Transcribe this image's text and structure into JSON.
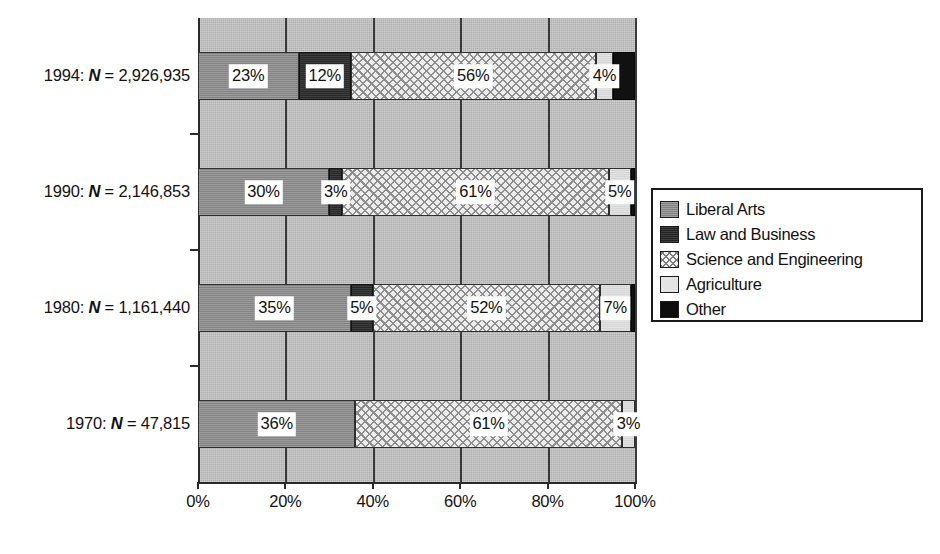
{
  "chart_data": {
    "type": "bar",
    "orientation": "horizontal",
    "stacked": true,
    "normalized_percent": true,
    "title": "",
    "subtitle": "",
    "xlabel": "",
    "ylabel": "",
    "xlim": [
      0,
      100
    ],
    "xticks": [
      0,
      20,
      40,
      60,
      80,
      100
    ],
    "xtick_labels": [
      "0%",
      "20%",
      "40%",
      "60%",
      "80%",
      "100%"
    ],
    "grid": true,
    "grid_axis": "x",
    "legend_position": "right",
    "categories": [
      "1994: N = 2,926,935",
      "1990: N = 2,146,853",
      "1980: N = 1,161,440",
      "1970: N = 47,815"
    ],
    "category_rows": [
      {
        "year": "1994",
        "n_prefix": "1994: ",
        "n_symbol": "N",
        "n_value": " = 2,926,935",
        "values": [
          23,
          12,
          56,
          4,
          5
        ],
        "labels": [
          "23%",
          "12%",
          "56%",
          "4%",
          ""
        ]
      },
      {
        "year": "1990",
        "n_prefix": "1990: ",
        "n_symbol": "N",
        "n_value": " = 2,146,853",
        "values": [
          30,
          3,
          61,
          5,
          1
        ],
        "labels": [
          "30%",
          "3%",
          "61%",
          "5%",
          ""
        ]
      },
      {
        "year": "1980",
        "n_prefix": "1980: ",
        "n_symbol": "N",
        "n_value": " = 1,161,440",
        "values": [
          35,
          5,
          52,
          7,
          1
        ],
        "labels": [
          "35%",
          "5%",
          "52%",
          "7%",
          ""
        ]
      },
      {
        "year": "1970",
        "n_prefix": "1970: ",
        "n_symbol": "N",
        "n_value": " = 47,815",
        "values": [
          36,
          0,
          61,
          3,
          0
        ],
        "labels": [
          "36%",
          "",
          "61%",
          "3%",
          ""
        ]
      }
    ],
    "series": [
      {
        "name": "Liberal Arts",
        "key": "s-liberal",
        "color": "#8c8c8c",
        "values": [
          23,
          30,
          35,
          36
        ]
      },
      {
        "name": "Law and Business",
        "key": "s-law",
        "color": "#282828",
        "values": [
          12,
          3,
          5,
          0
        ]
      },
      {
        "name": "Science and Engineering",
        "key": "s-sci",
        "color": "#ededed",
        "values": [
          56,
          61,
          52,
          61
        ]
      },
      {
        "name": "Agriculture",
        "key": "s-agri",
        "color": "#e2e2e2",
        "values": [
          4,
          5,
          7,
          3
        ]
      },
      {
        "name": "Other",
        "key": "s-other",
        "color": "#111111",
        "values": [
          5,
          1,
          1,
          0
        ]
      }
    ]
  },
  "legend": {
    "items": [
      {
        "label": "Liberal Arts",
        "swatch": "s-liberal"
      },
      {
        "label": "Law and Business",
        "swatch": "s-law"
      },
      {
        "label": "Science and Engineering",
        "swatch": "s-sci"
      },
      {
        "label": "Agriculture",
        "swatch": "s-agri"
      },
      {
        "label": "Other",
        "swatch": "s-other"
      }
    ]
  },
  "axis": {
    "x_tick_labels": [
      "0%",
      "20%",
      "40%",
      "60%",
      "80%",
      "100%"
    ]
  }
}
